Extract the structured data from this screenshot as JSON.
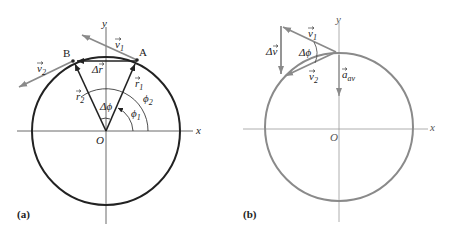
{
  "panels": [
    {
      "id": "a",
      "label": "(a)",
      "axes": {
        "x_label": "x",
        "y_label": "y",
        "origin_label": "O"
      },
      "points": {
        "A": "A",
        "B": "B"
      },
      "vectors": {
        "v1": {
          "sym": "v",
          "sub": "1"
        },
        "v2": {
          "sym": "v",
          "sub": "2"
        },
        "r1": {
          "sym": "r",
          "sub": "1"
        },
        "r2": {
          "sym": "r",
          "sub": "2"
        },
        "dr": {
          "sym": "Δr"
        }
      },
      "angles": {
        "dphi": "Δϕ",
        "phi1": {
          "sym": "ϕ",
          "sub": "1"
        },
        "phi2": {
          "sym": "ϕ",
          "sub": "2"
        }
      }
    },
    {
      "id": "b",
      "label": "(b)",
      "axes": {
        "x_label": "x",
        "y_label": "y",
        "origin_label": "O"
      },
      "vectors": {
        "v1": {
          "sym": "v",
          "sub": "1"
        },
        "v2": {
          "sym": "v",
          "sub": "2"
        },
        "dv": {
          "sym": "Δv"
        },
        "a_av": {
          "sym": "a",
          "sub": "av"
        }
      },
      "angles": {
        "dphi": "Δϕ"
      }
    }
  ],
  "colors": {
    "dark": "#222222",
    "gray": "#8a8a8a",
    "axis": "#444444"
  }
}
